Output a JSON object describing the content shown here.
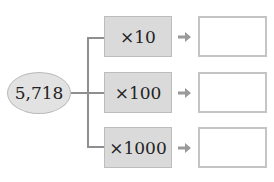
{
  "start_value": "5,718",
  "operations": [
    {
      "label": "×10",
      "answer": ""
    },
    {
      "label": "×100",
      "answer": ""
    },
    {
      "label": "×1000",
      "answer": ""
    }
  ],
  "colors": {
    "ellipse_fill": "#e2e2e2",
    "op_box_fill": "#dadada",
    "connector": "#8f8f8f",
    "arrow": "#9a9a9a",
    "answer_border": "#c4c4c4"
  }
}
